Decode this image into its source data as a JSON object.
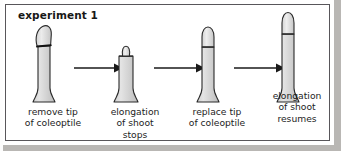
{
  "figure": {
    "title": "experiment 1",
    "background": "#ffffff",
    "border_color": "#58565a",
    "outer_background": "#b9b7b4"
  },
  "diagram": {
    "type": "process-sequence",
    "stage_count": 4,
    "arrow_count": 3,
    "arrow_direction": "right",
    "arrow_color": "#1a1a1a",
    "stages": [
      {
        "index": 1,
        "caption": "remove tip\nof coleoptile",
        "caption_lines": [
          "remove tip",
          "of coleoptile"
        ],
        "shoot_height": "tall",
        "tip_state": "intact-tilted",
        "tip_attached": true,
        "stem_fill": "#d9d9d9",
        "tip_fill": "#e2e2e2",
        "outline_color": "#2b2b2b"
      },
      {
        "index": 2,
        "caption": "elongation\nof shoot\nstops",
        "caption_lines": [
          "elongation",
          "of shoot",
          "stops"
        ],
        "shoot_height": "short",
        "tip_state": "detached-resting",
        "tip_attached": false,
        "stem_fill": "#d9d9d9",
        "tip_fill": "#e2e2e2",
        "outline_color": "#2b2b2b"
      },
      {
        "index": 3,
        "caption": "replace tip\nof coleoptile",
        "caption_lines": [
          "replace tip",
          "of coleoptile"
        ],
        "shoot_height": "medium",
        "tip_state": "replaced",
        "tip_attached": true,
        "stem_fill": "#d9d9d9",
        "tip_fill": "#e2e2e2",
        "outline_color": "#2b2b2b"
      },
      {
        "index": 4,
        "caption": "elongation\nof shoot\nresumes",
        "caption_lines": [
          "elongation",
          "of shoot",
          "resumes"
        ],
        "shoot_height": "tallest",
        "tip_state": "replaced",
        "tip_attached": true,
        "stem_fill": "#d9d9d9",
        "tip_fill": "#e2e2e2",
        "outline_color": "#2b2b2b"
      }
    ]
  }
}
